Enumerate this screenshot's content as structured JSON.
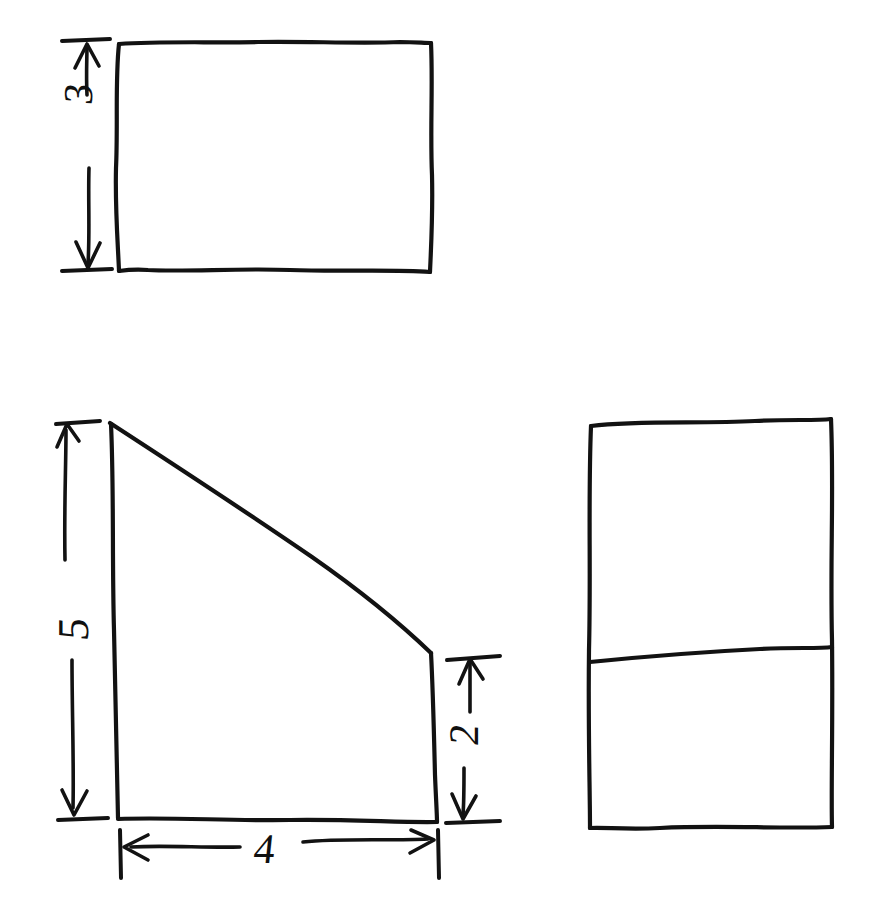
{
  "page": {
    "medium": "black pen on white paper",
    "background_color": "#ffffff",
    "ink_color": "#121212",
    "width": 889,
    "height": 902
  },
  "figures": [
    {
      "id": "rectangle-top-left",
      "name": "Rectangle with height dimension",
      "shape": "rectangle",
      "dimension_labels": [
        {
          "id": "label-3",
          "text": "3",
          "side": "left",
          "orientation": "rotated-90-ccw"
        }
      ],
      "has_arrow_dimension": true
    },
    {
      "id": "trapezoid-bottom-left",
      "name": "Right trapezoid with three dimensions",
      "shape": "right-trapezoid",
      "dimension_labels": [
        {
          "id": "label-5",
          "text": "5",
          "side": "left",
          "orientation": "rotated-90-ccw"
        },
        {
          "id": "label-2",
          "text": "2",
          "side": "right",
          "orientation": "rotated-90-ccw"
        },
        {
          "id": "label-4",
          "text": "4",
          "side": "bottom",
          "orientation": "upright"
        }
      ],
      "has_arrow_dimension": true
    },
    {
      "id": "rectangle-right-divided",
      "name": "Tall rectangle divided by a horizontal line",
      "shape": "rectangle-with-divider",
      "dimension_labels": [],
      "has_arrow_dimension": false
    }
  ],
  "labels": {
    "three": "3",
    "five": "5",
    "two": "2",
    "four": "4"
  }
}
